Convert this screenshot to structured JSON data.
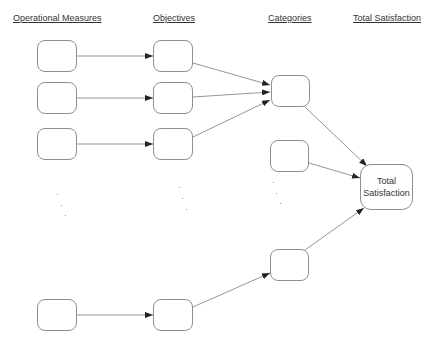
{
  "headers": {
    "operational_measures": "Operational Measures",
    "objectives": "Objectives",
    "categories": "Categories",
    "total_satisfaction": "Total Satisfaction"
  },
  "nodes": {
    "total": {
      "line1": "Total",
      "line2": "Satisfaction"
    }
  },
  "colors": {
    "node_border": "#8f8f8f",
    "edge": "#7a7a7a",
    "arrowhead": "#222222",
    "text": "#333333"
  },
  "diagram": {
    "columns": [
      "Operational Measures",
      "Objectives",
      "Categories",
      "Total Satisfaction"
    ],
    "edges": [
      [
        "measure-1",
        "objective-1"
      ],
      [
        "measure-2",
        "objective-2"
      ],
      [
        "measure-3",
        "objective-3"
      ],
      [
        "measure-n",
        "objective-n"
      ],
      [
        "objective-1",
        "category-1"
      ],
      [
        "objective-2",
        "category-1"
      ],
      [
        "objective-3",
        "category-1"
      ],
      [
        "objective-n",
        "category-n"
      ],
      [
        "category-1",
        "total"
      ],
      [
        "category-2",
        "total"
      ],
      [
        "category-n",
        "total"
      ]
    ]
  }
}
